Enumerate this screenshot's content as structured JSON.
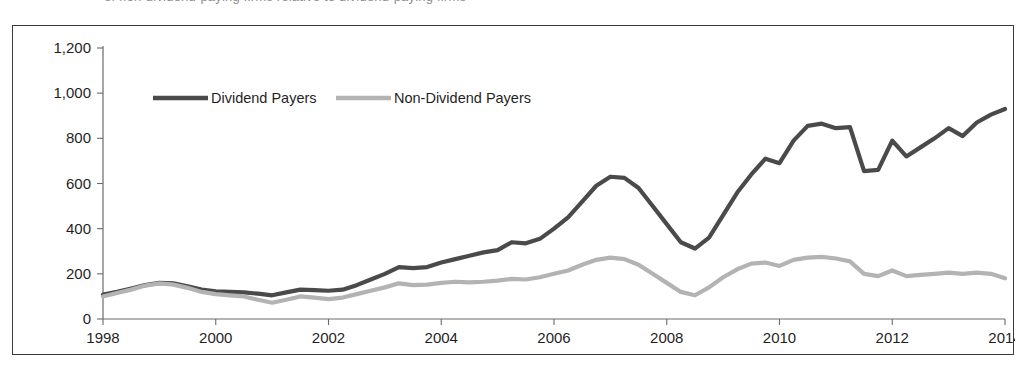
{
  "caption": {
    "text": "of non-dividend-paying firms relative to dividend-paying firms"
  },
  "colors": {
    "dividend_payers_line": "#4a4a4a",
    "non_dividend_payers_line": "#b3b3b3",
    "axis": "#6a6a6a",
    "frame": "#3a3a3a",
    "text": "#1f1f1f",
    "background": "#ffffff"
  },
  "legend": {
    "position": "top-left-inside",
    "entries": [
      {
        "label": "Dividend Payers",
        "color": "#4a4a4a"
      },
      {
        "label": "Non-Dividend Payers",
        "color": "#b3b3b3"
      }
    ]
  },
  "axes": {
    "y_ticks": [
      "0",
      "200",
      "400",
      "600",
      "800",
      "1,000",
      "1,200"
    ],
    "x_ticks": [
      "1998",
      "2000",
      "2002",
      "2004",
      "2006",
      "2008",
      "2010",
      "2012",
      "2014"
    ]
  },
  "chart_data": {
    "type": "line",
    "title": "",
    "subtitle": "",
    "xlabel": "",
    "ylabel": "",
    "xlim": [
      1998,
      2014
    ],
    "ylim": [
      0,
      1200
    ],
    "grid": false,
    "legend_position": "top-left",
    "x_tick_values": [
      1998,
      2000,
      2002,
      2004,
      2006,
      2008,
      2010,
      2012,
      2014
    ],
    "y_tick_values": [
      0,
      200,
      400,
      600,
      800,
      1000,
      1200
    ],
    "x": [
      1998.0,
      1998.25,
      1998.5,
      1998.75,
      1999.0,
      1999.25,
      1999.5,
      1999.75,
      2000.0,
      2000.25,
      2000.5,
      2000.75,
      2001.0,
      2001.25,
      2001.5,
      2001.75,
      2002.0,
      2002.25,
      2002.5,
      2002.75,
      2003.0,
      2003.25,
      2003.5,
      2003.75,
      2004.0,
      2004.25,
      2004.5,
      2004.75,
      2005.0,
      2005.25,
      2005.5,
      2005.75,
      2006.0,
      2006.25,
      2006.5,
      2006.75,
      2007.0,
      2007.25,
      2007.5,
      2007.75,
      2008.0,
      2008.25,
      2008.5,
      2008.75,
      2009.0,
      2009.25,
      2009.5,
      2009.75,
      2010.0,
      2010.25,
      2010.5,
      2010.75,
      2011.0,
      2011.25,
      2011.5,
      2011.75,
      2012.0,
      2012.25,
      2012.5,
      2012.75,
      2013.0,
      2013.25,
      2013.5,
      2013.75,
      2014.0
    ],
    "series": [
      {
        "name": "Dividend Payers",
        "color": "#4a4a4a",
        "values": [
          108,
          120,
          135,
          150,
          160,
          158,
          145,
          130,
          122,
          120,
          118,
          112,
          105,
          118,
          130,
          128,
          125,
          130,
          150,
          175,
          200,
          230,
          225,
          230,
          250,
          265,
          280,
          295,
          305,
          340,
          335,
          355,
          400,
          450,
          520,
          590,
          630,
          625,
          580,
          500,
          420,
          340,
          312,
          360,
          460,
          560,
          640,
          710,
          690,
          790,
          855,
          865,
          845,
          850,
          655,
          660,
          790,
          720,
          760,
          800,
          845,
          810,
          870,
          905,
          930
        ]
      },
      {
        "name": "Non-Dividend Payers",
        "color": "#b3b3b3",
        "values": [
          100,
          115,
          130,
          148,
          158,
          152,
          138,
          120,
          110,
          105,
          100,
          85,
          72,
          85,
          100,
          95,
          88,
          95,
          110,
          125,
          140,
          158,
          150,
          152,
          160,
          165,
          162,
          165,
          170,
          178,
          175,
          185,
          200,
          215,
          240,
          262,
          272,
          265,
          240,
          200,
          160,
          120,
          105,
          140,
          185,
          220,
          245,
          250,
          235,
          262,
          272,
          275,
          268,
          255,
          200,
          190,
          215,
          190,
          195,
          200,
          205,
          200,
          205,
          200,
          180
        ]
      }
    ]
  }
}
